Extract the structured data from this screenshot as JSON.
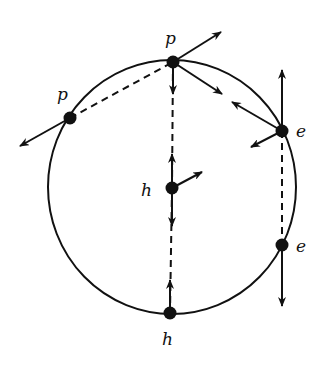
{
  "diagram": {
    "type": "particle-hole pair diagram on circle",
    "circle": {
      "cx": 172,
      "cy": 187,
      "r": 126
    },
    "labels": {
      "p_left": "p",
      "p_top": "p",
      "h_center": "h",
      "h_bottom": "h",
      "e_upper": "e",
      "e_lower": "e"
    },
    "nodes": [
      {
        "id": "p_left",
        "x": 70,
        "y": 118
      },
      {
        "id": "p_top",
        "x": 173,
        "y": 62
      },
      {
        "id": "h_center",
        "x": 172,
        "y": 188
      },
      {
        "id": "h_bottom",
        "x": 170,
        "y": 313
      },
      {
        "id": "e_upper",
        "x": 282,
        "y": 131
      },
      {
        "id": "e_lower",
        "x": 282,
        "y": 245
      }
    ],
    "colors": {
      "ink": "#111111",
      "background": "#ffffff"
    }
  }
}
